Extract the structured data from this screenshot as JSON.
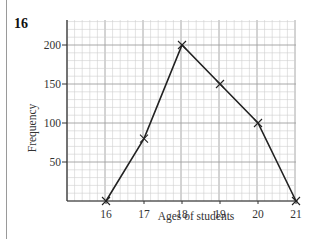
{
  "question_number": "16",
  "chart_data": {
    "type": "line",
    "title": "",
    "xlabel": "Ages of students",
    "ylabel": "Frequency",
    "categories": [
      "16",
      "17",
      "18",
      "19",
      "20",
      "21"
    ],
    "x": [
      16,
      17,
      18,
      19,
      20,
      21
    ],
    "values": [
      0,
      80,
      200,
      150,
      100,
      0
    ],
    "series": [
      {
        "name": "Frequency polygon",
        "values": [
          0,
          80,
          200,
          150,
          100,
          0
        ],
        "marker": "cross"
      }
    ],
    "xlim": [
      15,
      21
    ],
    "ylim": [
      0,
      230
    ],
    "y_ticks": [
      "50",
      "100",
      "150",
      "200"
    ],
    "x_ticks": [
      "16",
      "17",
      "18",
      "19",
      "20",
      "21"
    ],
    "grid": true,
    "legend": "none",
    "colors": {
      "line": "#222222",
      "grid_minor": "#cfcfcf",
      "grid_major": "#9e9e9e",
      "axis": "#333333"
    }
  }
}
